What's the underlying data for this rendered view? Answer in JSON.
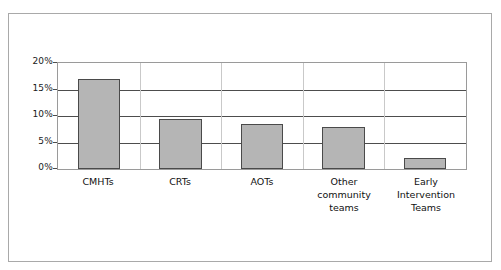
{
  "chart_data": {
    "type": "bar",
    "title": "",
    "subtitle": "",
    "xlabel": "",
    "ylabel": "",
    "categories": [
      "CMHTs",
      "CRTs",
      "AOTs",
      "Other\ncommunity\nteams",
      "Early\nIntervention\nTeams"
    ],
    "categories_plain": [
      "CMHTs",
      "CRTs",
      "AOTs",
      "Other community teams",
      "Early Intervention Teams"
    ],
    "values": [
      17,
      9.5,
      8.5,
      8,
      2
    ],
    "value_labels": [
      "17%",
      "9.5%",
      "8.5%",
      "8%",
      "2%"
    ],
    "ylim": [
      0,
      20
    ],
    "ytick_values": [
      0,
      5,
      10,
      15,
      20
    ],
    "ytick_labels": [
      "0%",
      "5%",
      "10%",
      "15%",
      "20%"
    ],
    "grid": true,
    "grid_orientation": "horizontal",
    "legend": false,
    "legend_position": "none",
    "series": [
      {
        "name": "",
        "values": [
          17,
          9.5,
          8.5,
          8,
          2
        ]
      }
    ],
    "colors": {
      "bar_fill": "#b5b5b5",
      "bar_border": "#4a4a4a",
      "gridline": "#4d4d4d",
      "plot_border": "#9a9a9a",
      "frame_border": "#a9a9a9",
      "text": "#111111",
      "background": "#ffffff"
    }
  }
}
